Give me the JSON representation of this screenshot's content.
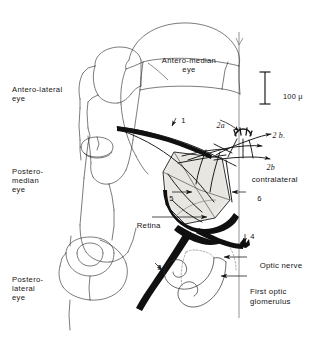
{
  "figure": {
    "background_color": "#ffffff",
    "ink_color": "#141414",
    "shade_color": "#e8e6e2",
    "dark_fill_color": "#101010"
  },
  "eye_labels": [
    {
      "key": "antero_lateral",
      "text": "Antero-lateral\neye"
    },
    {
      "key": "antero_median",
      "text": "Antero-median\neye"
    },
    {
      "key": "postero_median",
      "text": "Postero-\nmedian\neye"
    },
    {
      "key": "postero_lateral",
      "text": "Postero-\nlateral\neye"
    }
  ],
  "part_labels": [
    {
      "key": "retina",
      "text": "Retina"
    },
    {
      "key": "optic_nerve",
      "text": "Optic nerve"
    },
    {
      "key": "first_optic_glomerulus",
      "text": "First optic\nglomerulus"
    },
    {
      "key": "contralateral",
      "text": "contralateral"
    }
  ],
  "numbered_labels": [
    {
      "key": "n1",
      "text": "1"
    },
    {
      "key": "n2a",
      "text": "2a"
    },
    {
      "key": "n2b_dot",
      "text": "2 b."
    },
    {
      "key": "n2b_italic",
      "text": "2b"
    },
    {
      "key": "n3",
      "text": "3"
    },
    {
      "key": "n4",
      "text": "4"
    },
    {
      "key": "n5",
      "text": "5"
    },
    {
      "key": "n6",
      "text": "6"
    }
  ],
  "scale_bar": {
    "label": "100",
    "unit": "μ",
    "full_label": "100 μ"
  }
}
